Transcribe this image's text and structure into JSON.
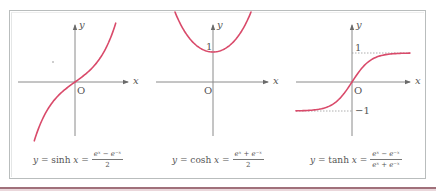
{
  "colors": {
    "curve": "#d94a6a",
    "axis": "#8a8a8a",
    "frame": "#b9bdbd",
    "stripe": "#a0707a"
  },
  "chart_data": [
    {
      "type": "line",
      "title": "y = sinh x = (e^x − e^−x)/2",
      "xlabel": "x",
      "ylabel": "y",
      "origin_label": "O",
      "function": "sinh",
      "x": [
        -2.2,
        -1.5,
        -1,
        -0.5,
        0,
        0.5,
        1,
        1.5,
        2.2
      ],
      "values": [
        -4.46,
        -2.13,
        -1.18,
        -0.52,
        0,
        0.52,
        1.18,
        2.13,
        4.46
      ],
      "grid": false
    },
    {
      "type": "line",
      "title": "y = cosh x = (e^x + e^−x)/2",
      "xlabel": "x",
      "ylabel": "y",
      "origin_label": "O",
      "tick_labels": [
        "1"
      ],
      "function": "cosh",
      "x": [
        -1.5,
        -1,
        -0.5,
        0,
        0.5,
        1,
        1.5
      ],
      "values": [
        2.35,
        1.54,
        1.13,
        1,
        1.13,
        1.54,
        2.35
      ],
      "grid": false
    },
    {
      "type": "line",
      "title": "y = tanh x = (e^x − e^−x)/(e^x + e^−x)",
      "xlabel": "x",
      "ylabel": "y",
      "origin_label": "O",
      "tick_labels": [
        "1",
        "−1"
      ],
      "asymptotes": [
        1,
        -1
      ],
      "function": "tanh",
      "x": [
        -3,
        -2,
        -1,
        0,
        1,
        2,
        3
      ],
      "values": [
        -0.995,
        -0.964,
        -0.762,
        0,
        0.762,
        0.964,
        0.995
      ],
      "grid": false
    }
  ],
  "graphs": {
    "sinh": {
      "axis_y": "y",
      "axis_x": "x",
      "origin": "O",
      "formula_lhs": "y",
      "formula_eq": " = sinh ",
      "formula_var": "x",
      "formula_eq2": " =",
      "numerator": "eˣ − e⁻ˣ",
      "denominator": "2"
    },
    "cosh": {
      "axis_y": "y",
      "axis_x": "x",
      "origin": "O",
      "tick_one": "1",
      "formula_lhs": "y",
      "formula_eq": " = cosh ",
      "formula_var": "x",
      "formula_eq2": " =",
      "numerator": "eˣ + e⁻ˣ",
      "denominator": "2"
    },
    "tanh": {
      "axis_y": "y",
      "axis_x": "x",
      "origin": "O",
      "tick_one": "1",
      "tick_minus_one": "−1",
      "formula_lhs": "y",
      "formula_eq": " = tanh ",
      "formula_var": "x",
      "formula_eq2": " =",
      "numerator": "eˣ − e⁻ˣ",
      "denominator": "eˣ + e⁻ˣ"
    }
  }
}
